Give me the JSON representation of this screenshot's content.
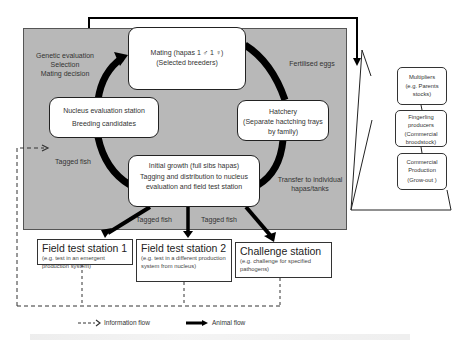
{
  "diagram": {
    "cycle": {
      "mating": {
        "title": "Mating  (hapas 1 ♂ 1 ♀)",
        "subtitle": "(Selected breeders)"
      },
      "hatchery": {
        "title": "Hatchery",
        "subtitle": "(Separate hactching trays by family)"
      },
      "initial_growth": {
        "title": "Initial growth (full sibs hapas)",
        "subtitle": "Tagging and distribution to nucleus evaluation and field test station"
      },
      "nucleus": {
        "title": "Nucleus evaluation station",
        "subtitle": "Breeding candidates"
      }
    },
    "cycle_labels": {
      "genetic": [
        "Genetic evaluation",
        "Selection",
        "Mating decision"
      ],
      "fertilised": "Fertilised eggs",
      "transfer": [
        "Transfer to individual",
        "hapas/tanks"
      ],
      "tagged_left": "Tagged  fish",
      "tagged_mid_left": "Tagged  fish",
      "tagged_mid_right": "Tagged  fish"
    },
    "stations": [
      {
        "title": "Field test station 1",
        "subtitle": "(e.g. test in an emergent production system)"
      },
      {
        "title": "Field test station 2",
        "subtitle": "(e.g. test in a different production system  from nucleus)"
      },
      {
        "title": "Challenge station",
        "subtitle": "(e.g. challenge for specified pathogens)"
      }
    ],
    "pyramid": [
      {
        "lines": [
          "Multipliers",
          "(e.g. Parents",
          "stocks)"
        ]
      },
      {
        "lines": [
          "Fingerling",
          "producers",
          "(Commercial",
          "broodstock)"
        ]
      },
      {
        "lines": [
          "Commercial",
          "Production",
          "(Grow-out )"
        ]
      }
    ],
    "legend": {
      "info_flow": "Information flow",
      "animal_flow": "Animal flow"
    },
    "colors": {
      "panel": "#b8b8b8",
      "arrow": "#000000",
      "box_border": "#222222"
    }
  }
}
